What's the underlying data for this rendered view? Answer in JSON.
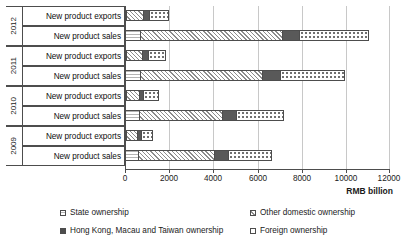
{
  "chart_data": {
    "type": "bar",
    "orientation": "horizontal",
    "stacked": true,
    "title": "",
    "xlabel": "RMB billion",
    "ylabel": "",
    "xlim": [
      0,
      12000
    ],
    "xticks": [
      0,
      2000,
      4000,
      6000,
      8000,
      10000,
      12000
    ],
    "xtick_labels": [
      "0",
      "2000",
      "4000",
      "6000",
      "8000",
      "10000",
      "12000"
    ],
    "grid": "vertical",
    "legend_position": "bottom",
    "groups": [
      "2012",
      "2011",
      "2010",
      "2009"
    ],
    "categories": [
      "New product exports",
      "New product sales"
    ],
    "series": [
      {
        "name": "State ownership",
        "key": "state",
        "values": {
          "2012": {
            "New product exports": 30,
            "New product sales": 700
          },
          "2011": {
            "New product exports": 30,
            "New product sales": 670
          },
          "2010": {
            "New product exports": 25,
            "New product sales": 630
          },
          "2009": {
            "New product exports": 25,
            "New product sales": 590
          }
        }
      },
      {
        "name": "Other domestic ownership",
        "key": "otherdom",
        "values": {
          "2012": {
            "New product exports": 790,
            "New product sales": 6400
          },
          "2011": {
            "New product exports": 720,
            "New product sales": 5530
          },
          "2010": {
            "New product exports": 575,
            "New product sales": 3760
          },
          "2009": {
            "New product exports": 480,
            "New product sales": 3440
          }
        }
      },
      {
        "name": "Hong Kong, Macau and Taiwan ownership",
        "key": "hkmt",
        "values": {
          "2012": {
            "New product exports": 250,
            "New product sales": 800
          },
          "2011": {
            "New product exports": 270,
            "New product sales": 800
          },
          "2010": {
            "New product exports": 215,
            "New product sales": 630
          },
          "2009": {
            "New product exports": 200,
            "New product sales": 630
          }
        }
      },
      {
        "name": "Foreign ownership",
        "key": "foreign",
        "values": {
          "2012": {
            "New product exports": 900,
            "New product sales": 3150
          },
          "2011": {
            "New product exports": 830,
            "New product sales": 2950
          },
          "2010": {
            "New product exports": 685,
            "New product sales": 2170
          },
          "2009": {
            "New product exports": 545,
            "New product sales": 1990
          }
        }
      }
    ],
    "totals": {
      "2012": {
        "New product exports": 1970,
        "New product sales": 11050
      },
      "2011": {
        "New product exports": 1850,
        "New product sales": 9950
      },
      "2010": {
        "New product exports": 1500,
        "New product sales": 7190
      },
      "2009": {
        "New product exports": 1250,
        "New product sales": 6650
      }
    }
  },
  "axis": {
    "x_title": "RMB billion",
    "tick_labels": [
      "0",
      "2000",
      "4000",
      "6000",
      "8000",
      "10000",
      "12000"
    ]
  },
  "years": [
    {
      "label": "2012"
    },
    {
      "label": "2011"
    },
    {
      "label": "2010"
    },
    {
      "label": "2009"
    }
  ],
  "category_labels": {
    "exports": "New product exports",
    "sales": "New product sales"
  },
  "legend": {
    "items": [
      {
        "label": "State ownership",
        "key": "state"
      },
      {
        "label": "Other domestic ownership",
        "key": "otherdom"
      },
      {
        "label": "Hong Kong, Macau and Taiwan ownership",
        "key": "hkmt"
      },
      {
        "label": "Foreign ownership",
        "key": "foreign"
      }
    ]
  },
  "colors": {
    "axis": "#4d4d4d",
    "grid": "#c8c8c8",
    "hkmt_fill": "#595959",
    "text": "#1a1a1a"
  }
}
